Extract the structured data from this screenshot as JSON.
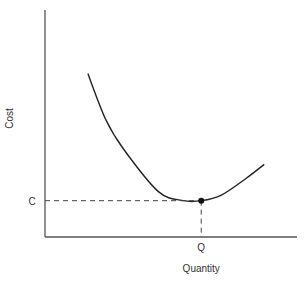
{
  "chart_data": {
    "type": "line",
    "title": "",
    "xlabel": "Quantity",
    "ylabel": "Cost",
    "xlim": [
      0,
      10
    ],
    "ylim": [
      0,
      10
    ],
    "grid": false,
    "legend": null,
    "series": [
      {
        "name": "cost-curve",
        "x": [
          1.7,
          2.4,
          3.1,
          4.5,
          5.5,
          6.2,
          7.0,
          8.0,
          8.7
        ],
        "y": [
          7.2,
          5.2,
          3.9,
          2.0,
          1.6,
          1.6,
          1.85,
          2.6,
          3.2
        ]
      }
    ],
    "highlight_point": {
      "x": 6.2,
      "y": 1.6,
      "x_label": "Q",
      "y_label": "C"
    },
    "annotations": [
      {
        "text": "C",
        "axis": "y",
        "value": 1.6
      },
      {
        "text": "Q",
        "axis": "x",
        "value": 6.2
      }
    ]
  }
}
